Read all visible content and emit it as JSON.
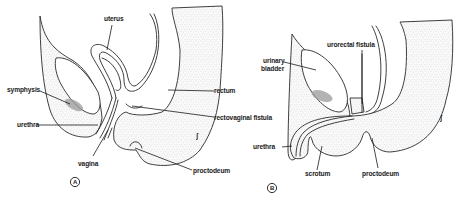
{
  "figure": {
    "panels": [
      {
        "id": "A",
        "marker": "A",
        "labels": {
          "uterus": "uterus",
          "symphysis": "symphysis",
          "urethra": "urethra",
          "vagina": "vagina",
          "rectum": "rectum",
          "rectovaginal_fistula": "rectovaginal fistula",
          "proctodeum": "proctodeum"
        },
        "symbol": "ʃ"
      },
      {
        "id": "B",
        "marker": "B",
        "labels": {
          "urinary_bladder_line1": "urinary",
          "urinary_bladder_line2": "bladder",
          "urorectal_fistula": "urorectal fistula",
          "urethra": "urethra",
          "scrotum": "scrotum",
          "proctodeum": "proctodeum"
        },
        "symbol": "ʃ"
      }
    ],
    "colors": {
      "line": "#2a2a2a",
      "stipple": "#8a8a8a",
      "bone": "#9a9a9a",
      "background": "#ffffff"
    }
  }
}
